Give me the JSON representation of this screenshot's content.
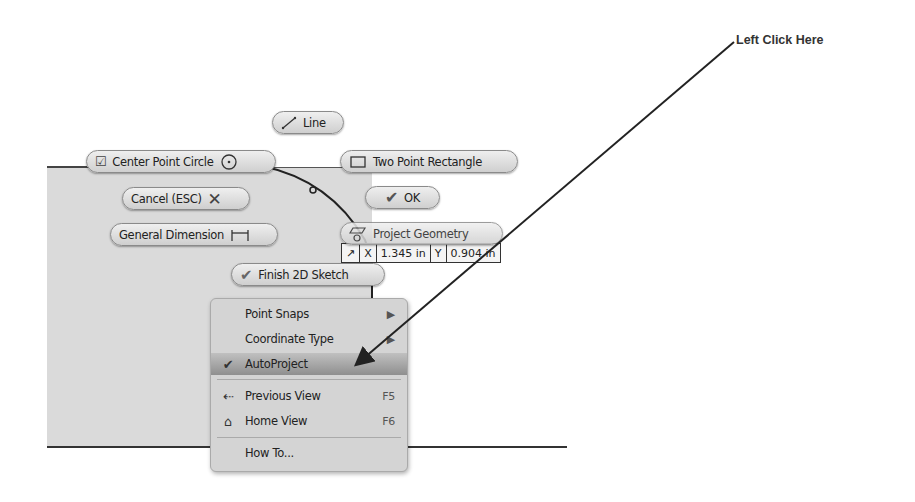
{
  "callout": {
    "text": "Left Click Here"
  },
  "marking_menu": {
    "line": {
      "label": "Line",
      "icon": "line-icon"
    },
    "center_point_circle": {
      "label": "Center Point Circle",
      "icon": "center-point-circle-icon"
    },
    "two_point_rectangle": {
      "label": "Two Point Rectangle",
      "icon": "rectangle-icon"
    },
    "cancel": {
      "label": "Cancel (ESC)",
      "icon": "x-icon"
    },
    "ok": {
      "label": "OK",
      "icon": "checkmark-icon"
    },
    "general_dimension": {
      "label": "General Dimension",
      "icon": "dimension-icon"
    },
    "project_geometry": {
      "label": "Project Geometry",
      "icon": "project-geometry-icon"
    },
    "finish_sketch": {
      "label": "Finish 2D Sketch",
      "icon": "checkmark-icon"
    }
  },
  "coordinate_input": {
    "x_label": "X",
    "x_value": "1.345 in",
    "y_label": "Y",
    "y_value": "0.904 in"
  },
  "context_menu": {
    "items": [
      {
        "label": "Point Snaps",
        "submenu": true
      },
      {
        "label": "Coordinate Type",
        "submenu": true
      },
      {
        "label": "AutoProject",
        "checked": true,
        "highlighted": true
      },
      {
        "label": "Previous View",
        "shortcut": "F5",
        "icon": "previous-view-icon"
      },
      {
        "label": "Home View",
        "shortcut": "F6",
        "icon": "home-icon"
      },
      {
        "label": "How To..."
      }
    ]
  }
}
